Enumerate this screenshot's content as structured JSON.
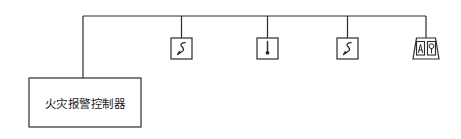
{
  "diagram": {
    "type": "fire-alarm-riser-diagram",
    "stroke_color": "#2b2b2b",
    "background_color": "#ffffff",
    "control_panel": {
      "label": "火灾报警控制器",
      "x": 29,
      "y": 78,
      "width": 112,
      "height": 49
    },
    "bus": {
      "y": 16,
      "x_start": 83,
      "x_end": 426,
      "riser_x": 83,
      "riser_y_bottom": 78
    },
    "devices": [
      {
        "name": "smoke-detector-1",
        "label": "S",
        "symbol": "smoke-detector",
        "x": 171,
        "y": 38,
        "width": 21,
        "height": 21,
        "drop_x": 181.5
      },
      {
        "name": "heat-detector",
        "label": "",
        "symbol": "heat-detector",
        "x": 257,
        "y": 38,
        "width": 21,
        "height": 21,
        "drop_x": 267.5
      },
      {
        "name": "smoke-detector-2",
        "label": "S",
        "symbol": "smoke-detector",
        "x": 337,
        "y": 38,
        "width": 21,
        "height": 21,
        "drop_x": 347.5
      },
      {
        "name": "manual-call-point-module",
        "label": "",
        "symbol": "dual-module",
        "x": 414,
        "y": 38,
        "width": 26,
        "height": 21,
        "drop_x": 426
      }
    ]
  }
}
